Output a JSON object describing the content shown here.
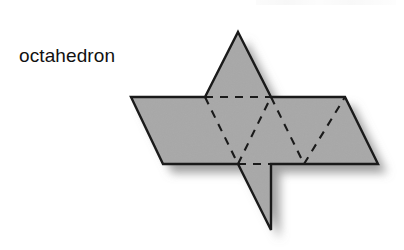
{
  "figure": {
    "label": "octahedron",
    "label_color": "#111111",
    "background_color": "#ffffff",
    "face_fill_color": "#a8a8a8",
    "cut_edge_color": "#1a1a1a",
    "fold_edge_color": "#1a1a1a",
    "shadow_color": "#8a8a8a",
    "fold_edge_style": "dashed",
    "cut_edge_style": "solid",
    "solid_name": "octahedron",
    "face_count": 8,
    "face_shape": "equilateral triangle",
    "diagram_type": "polyhedron net",
    "geometry": {
      "band_top_y": 97,
      "band_bottom_y": 164,
      "band_left_top_x": 131,
      "band_right_top_x": 345,
      "band_left_bottom_x": 163,
      "band_right_bottom_x": 378,
      "triangle_half_width": 33,
      "triangle_height": 67,
      "top_apex_x": 238,
      "top_apex_y": 32,
      "bottom_apex_x": 271,
      "bottom_apex_y": 230,
      "outline_points": "238,32 271,97 345,97 378,164 271,164 271,230 238,164 163,164 131,97 205,97",
      "fold_lines": [
        "205,97 238,164",
        "238,164 271,97",
        "271,97 304,164",
        "304,164 345,97",
        "205,97 345,97",
        "238,164 378,164"
      ]
    }
  }
}
